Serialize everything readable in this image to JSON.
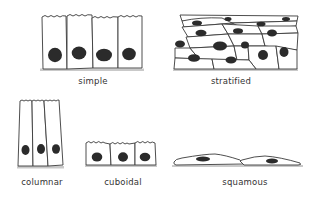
{
  "diagram": {
    "colors": {
      "outline": "#3a3a3a",
      "nucleus": "#2b2b2b",
      "basement": "#c9c9c9",
      "background": "#ffffff",
      "label": "#333333"
    },
    "panels": [
      {
        "id": "simple",
        "label": "simple",
        "label_pos": [
          93,
          76
        ],
        "cells": 4
      },
      {
        "id": "stratified",
        "label": "stratified",
        "label_pos": [
          231,
          76
        ],
        "layers": 4
      },
      {
        "id": "columnar",
        "label": "columnar",
        "label_pos": [
          42,
          177
        ],
        "cells": 3
      },
      {
        "id": "cuboidal",
        "label": "cuboidal",
        "label_pos": [
          123,
          177
        ],
        "cells": 3
      },
      {
        "id": "squamous",
        "label": "squamous",
        "label_pos": [
          245,
          177
        ],
        "cells": 2
      }
    ]
  }
}
